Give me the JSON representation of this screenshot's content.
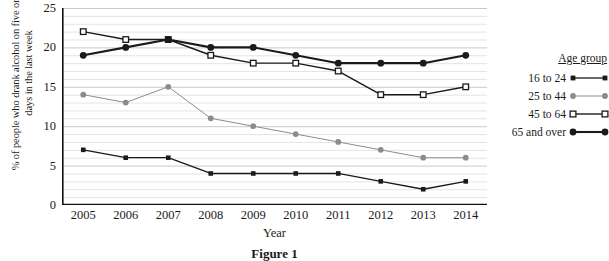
{
  "chart_data": {
    "type": "line",
    "title": "",
    "xlabel": "Year",
    "ylabel": "% of people who drank alcohol on five or more days in the last week",
    "categories": [
      "2005",
      "2006",
      "2007",
      "2008",
      "2009",
      "2010",
      "2011",
      "2012",
      "2013",
      "2014"
    ],
    "ylim": [
      0,
      25
    ],
    "yticks": [
      0,
      5,
      10,
      15,
      20,
      25
    ],
    "grid": "horizontal-minor-every-1",
    "legend_position": "right",
    "legend_title": "Age group",
    "series": [
      {
        "name": "16 to 24",
        "color": "#1a1a1a",
        "marker": "filled-square",
        "values": [
          7,
          6,
          6,
          4,
          4,
          4,
          4,
          3,
          2,
          3
        ]
      },
      {
        "name": "25 to 44",
        "color": "#8c8c8c",
        "marker": "filled-circle",
        "values": [
          14,
          13,
          15,
          11,
          10,
          9,
          8,
          7,
          6,
          6
        ]
      },
      {
        "name": "45 to 64",
        "color": "#1a1a1a",
        "marker": "open-square",
        "values": [
          22,
          21,
          21,
          19,
          18,
          18,
          17,
          14,
          14,
          15
        ]
      },
      {
        "name": "65 and over",
        "color": "#1a1a1a",
        "marker": "filled-circle-bold",
        "values": [
          19,
          20,
          21,
          20,
          20,
          19,
          18,
          18,
          18,
          19
        ]
      }
    ]
  },
  "caption": "Figure 1",
  "legend": {
    "title": "Age group",
    "items": [
      {
        "label": "16 to 24"
      },
      {
        "label": "25 to 44"
      },
      {
        "label": "45 to 64"
      },
      {
        "label": "65 and over"
      }
    ]
  }
}
